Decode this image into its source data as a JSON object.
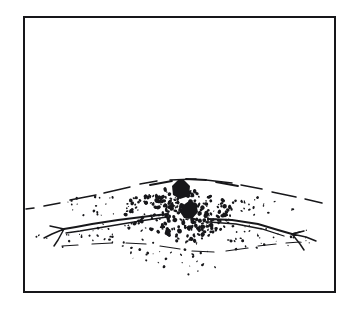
{
  "figure": {
    "medium": "pen-and-ink line drawing",
    "caption_text": "",
    "background_color": "#ffffff",
    "ink_color": "#17171a"
  },
  "frame": {
    "name": "rectangular-border",
    "x": 24,
    "y": 17,
    "width": 311,
    "height": 275,
    "stroke_width": 2,
    "stroke_color": "#17171a",
    "fill_color": "#ffffff"
  },
  "scene": {
    "description": "Low mounded ground surface crossing the lower third of the frame. A broken contour arcs over a rise. Two angular black boulders sit near the crest. Two root-like branches with forked ends extend left and right from a central gravel-strewn depression. Loose stippled gravel is scattered around the center and trails downward.",
    "empty_upper_region": "The upper two thirds of the framed area is blank white paper.",
    "elements": [
      {
        "name": "ridge-contour",
        "label": "Broken arcing ridge contour line",
        "kind": "dashed-line"
      },
      {
        "name": "boulder-upper",
        "label": "Upper angular black boulder",
        "kind": "filled-polygon"
      },
      {
        "name": "boulder-lower",
        "label": "Lower angular black boulder",
        "kind": "filled-polygon"
      },
      {
        "name": "branch-left",
        "label": "Left root branch with forked end",
        "kind": "stroke-path"
      },
      {
        "name": "branch-right",
        "label": "Right root branch with forked end",
        "kind": "stroke-path"
      },
      {
        "name": "gravel-field",
        "label": "Scattered gravel stipple field",
        "kind": "stipple"
      },
      {
        "name": "lower-ground-line",
        "label": "Lower broken ground line",
        "kind": "dashed-line"
      }
    ]
  },
  "geometry": {
    "ridge_contour_path": "M26,209 L34,208 M44,206 L60,203 M70,200 L96,195 M104,193 L130,187 M140,184 L157,181 M170,180 L196,179 M206,180 L232,183 M241,185 L262,189 M272,192 L296,197 M305,199 L322,203",
    "ridge_upper_arc": "M128,190 C150,180 176,176 200,178 C224,180 244,186 258,191",
    "ridge_arc_breaks": "M150,185 L172,181 M186,179 L206,180 M216,182 L238,186",
    "lower_ground_path": "M62,246 L78,245 M92,244 L112,243 M126,243 L146,244 M160,246 L180,249 M192,251 L214,252 M226,251 L248,248 M258,246 L276,244 M286,243 L300,242",
    "boulder_upper_points": "172,186 178,180 184,180 190,186 189,196 180,199 173,195",
    "boulder_lower_points": "182,206 189,201 196,203 198,212 192,219 184,218 180,212",
    "branch_left_main": "M168,214 L150,216 L118,220 L92,224 L76,227 L64,229",
    "branch_left_second": "M167,217 L140,221 L104,227 L80,231 L66,233",
    "branch_left_forks": "M64,229 L50,226 M64,229 L52,234 M64,229 L58,240 M58,240 L54,246 M52,234 L44,238",
    "branch_right_main": "M208,219 L232,220 L258,224 L278,230 L292,234",
    "branch_right_second": "M209,222 L236,224 L262,229 L284,236 M292,234 L300,232",
    "branch_right_forks": "M292,234 L304,231 M292,234 L306,237 M292,234 L300,244 M300,244 L304,250 M306,237 L316,241",
    "branch_left_tip_cap": "M168,214 L168,218",
    "branch_right_tip_cap": "M208,219 L208,223"
  },
  "stipple": {
    "note": "Gravel specks rendered as small dark marks; positions and sizes describe the scatter pattern.",
    "dense_clusters": [
      {
        "cx": 150,
        "cy": 212,
        "rx": 26,
        "ry": 18,
        "count": 90
      },
      {
        "cx": 205,
        "cy": 214,
        "rx": 28,
        "ry": 18,
        "count": 95
      },
      {
        "cx": 178,
        "cy": 198,
        "rx": 22,
        "ry": 12,
        "count": 55
      },
      {
        "cx": 186,
        "cy": 230,
        "rx": 30,
        "ry": 12,
        "count": 60
      }
    ],
    "sparse_clusters": [
      {
        "cx": 120,
        "cy": 236,
        "rx": 32,
        "ry": 14,
        "count": 26
      },
      {
        "cx": 240,
        "cy": 236,
        "rx": 34,
        "ry": 14,
        "count": 28
      },
      {
        "cx": 168,
        "cy": 252,
        "rx": 44,
        "ry": 12,
        "count": 24
      },
      {
        "cx": 96,
        "cy": 206,
        "rx": 34,
        "ry": 10,
        "count": 18
      },
      {
        "cx": 264,
        "cy": 206,
        "rx": 36,
        "ry": 10,
        "count": 20
      },
      {
        "cx": 60,
        "cy": 240,
        "rx": 26,
        "ry": 10,
        "count": 10
      },
      {
        "cx": 296,
        "cy": 238,
        "rx": 26,
        "ry": 10,
        "count": 10
      },
      {
        "cx": 190,
        "cy": 268,
        "rx": 30,
        "ry": 8,
        "count": 8
      }
    ],
    "random_seed": 20240917
  }
}
